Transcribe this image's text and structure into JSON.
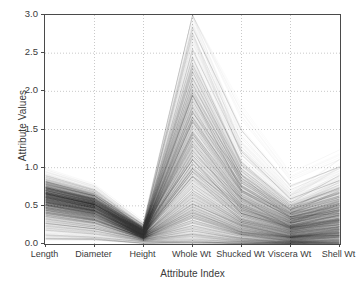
{
  "chart_data": {
    "type": "line",
    "title": "",
    "xlabel": "Attribute Index",
    "ylabel": "Attribute Values",
    "categories": [
      "Length",
      "Diameter",
      "Height",
      "Whole Wt",
      "Shucked Wt",
      "Viscera Wt",
      "Shell Wt"
    ],
    "ylim": [
      0.0,
      3.0
    ],
    "yticks": [
      "0.0",
      "0.5",
      "1.0",
      "1.5",
      "2.0",
      "2.5",
      "3.0"
    ],
    "ytick_values": [
      0.0,
      0.5,
      1.0,
      1.5,
      2.0,
      2.5,
      3.0
    ],
    "grid": true,
    "grid_style": "dotted",
    "legend": "none",
    "line_color": "#2b2b2b",
    "line_opacity": 0.12,
    "axis_color": "#4a4a4a",
    "grid_color": "#bbbbbb",
    "background": "#ffffff",
    "note": "Parallel coordinates plot of abalone physical measurements; each polyline is one specimen.",
    "axis_ranges": [
      {
        "name": "Length",
        "min": 0.07,
        "max": 0.82,
        "median": 0.55
      },
      {
        "name": "Diameter",
        "min": 0.06,
        "max": 0.65,
        "median": 0.43
      },
      {
        "name": "Height",
        "min": 0.01,
        "max": 0.26,
        "median": 0.14
      },
      {
        "name": "Whole Wt",
        "min": 0.02,
        "max": 2.83,
        "median": 0.8
      },
      {
        "name": "Shucked Wt",
        "min": 0.01,
        "max": 1.49,
        "median": 0.34
      },
      {
        "name": "Viscera Wt",
        "min": 0.0,
        "max": 0.76,
        "median": 0.17
      },
      {
        "name": "Shell Wt",
        "min": 0.0,
        "max": 1.01,
        "median": 0.23
      }
    ],
    "series": [
      {
        "name": "s1",
        "values": [
          0.82,
          0.65,
          0.25,
          2.83,
          1.49,
          0.76,
          1.01
        ]
      },
      {
        "name": "s2",
        "values": [
          0.78,
          0.63,
          0.22,
          2.55,
          1.21,
          0.59,
          0.83
        ]
      },
      {
        "name": "s3",
        "values": [
          0.8,
          0.63,
          0.23,
          2.44,
          1.04,
          0.54,
          0.9
        ]
      },
      {
        "name": "s4",
        "values": [
          0.76,
          0.6,
          0.21,
          2.35,
          1.07,
          0.51,
          0.72
        ]
      },
      {
        "name": "s5",
        "values": [
          0.75,
          0.6,
          0.2,
          2.26,
          0.98,
          0.49,
          0.74
        ]
      },
      {
        "name": "s6",
        "values": [
          0.74,
          0.59,
          0.19,
          2.18,
          0.95,
          0.47,
          0.68
        ]
      },
      {
        "name": "s7",
        "values": [
          0.73,
          0.58,
          0.2,
          2.1,
          0.9,
          0.45,
          0.66
        ]
      },
      {
        "name": "s8",
        "values": [
          0.74,
          0.59,
          0.18,
          2.03,
          0.86,
          0.44,
          0.63
        ]
      },
      {
        "name": "s9",
        "values": [
          0.72,
          0.57,
          0.18,
          1.95,
          0.83,
          0.42,
          0.61
        ]
      },
      {
        "name": "s10",
        "values": [
          0.71,
          0.56,
          0.19,
          1.88,
          0.8,
          0.41,
          0.59
        ]
      },
      {
        "name": "s11",
        "values": [
          0.72,
          0.57,
          0.17,
          1.8,
          0.77,
          0.39,
          0.57
        ]
      },
      {
        "name": "s12",
        "values": [
          0.7,
          0.55,
          0.17,
          1.73,
          0.74,
          0.38,
          0.55
        ]
      },
      {
        "name": "s13",
        "values": [
          0.69,
          0.55,
          0.18,
          1.66,
          0.71,
          0.36,
          0.53
        ]
      },
      {
        "name": "s14",
        "values": [
          0.7,
          0.56,
          0.16,
          1.6,
          0.68,
          0.35,
          0.51
        ]
      },
      {
        "name": "s15",
        "values": [
          0.68,
          0.54,
          0.16,
          1.53,
          0.65,
          0.33,
          0.49
        ]
      },
      {
        "name": "s16",
        "values": [
          0.67,
          0.53,
          0.17,
          1.47,
          0.63,
          0.32,
          0.47
        ]
      },
      {
        "name": "s17",
        "values": [
          0.68,
          0.54,
          0.15,
          1.4,
          0.6,
          0.31,
          0.45
        ]
      },
      {
        "name": "s18",
        "values": [
          0.66,
          0.52,
          0.15,
          1.34,
          0.57,
          0.29,
          0.43
        ]
      },
      {
        "name": "s19",
        "values": [
          0.65,
          0.51,
          0.16,
          1.28,
          0.55,
          0.28,
          0.41
        ]
      },
      {
        "name": "s20",
        "values": [
          0.66,
          0.52,
          0.14,
          1.22,
          0.52,
          0.27,
          0.4
        ]
      },
      {
        "name": "s21",
        "values": [
          0.64,
          0.5,
          0.14,
          1.16,
          0.5,
          0.25,
          0.38
        ]
      },
      {
        "name": "s22",
        "values": [
          0.63,
          0.49,
          0.15,
          1.1,
          0.47,
          0.24,
          0.36
        ]
      },
      {
        "name": "s23",
        "values": [
          0.62,
          0.49,
          0.13,
          1.05,
          0.45,
          0.23,
          0.34
        ]
      },
      {
        "name": "s24",
        "values": [
          0.61,
          0.48,
          0.13,
          0.99,
          0.43,
          0.22,
          0.33
        ]
      },
      {
        "name": "s25",
        "values": [
          0.6,
          0.47,
          0.14,
          0.94,
          0.4,
          0.21,
          0.31
        ]
      },
      {
        "name": "s26",
        "values": [
          0.59,
          0.46,
          0.12,
          0.89,
          0.38,
          0.19,
          0.29
        ]
      },
      {
        "name": "s27",
        "values": [
          0.58,
          0.45,
          0.12,
          0.84,
          0.36,
          0.18,
          0.28
        ]
      },
      {
        "name": "s28",
        "values": [
          0.57,
          0.44,
          0.13,
          0.79,
          0.34,
          0.17,
          0.26
        ]
      },
      {
        "name": "s29",
        "values": [
          0.56,
          0.43,
          0.11,
          0.74,
          0.32,
          0.16,
          0.25
        ]
      },
      {
        "name": "s30",
        "values": [
          0.55,
          0.43,
          0.11,
          0.7,
          0.3,
          0.15,
          0.23
        ]
      },
      {
        "name": "s31",
        "values": [
          0.54,
          0.42,
          0.12,
          0.65,
          0.28,
          0.14,
          0.22
        ]
      },
      {
        "name": "s32",
        "values": [
          0.52,
          0.4,
          0.1,
          0.61,
          0.26,
          0.13,
          0.2
        ]
      },
      {
        "name": "s33",
        "values": [
          0.51,
          0.39,
          0.1,
          0.57,
          0.24,
          0.12,
          0.19
        ]
      },
      {
        "name": "s34",
        "values": [
          0.5,
          0.38,
          0.11,
          0.53,
          0.23,
          0.11,
          0.18
        ]
      },
      {
        "name": "s35",
        "values": [
          0.48,
          0.37,
          0.09,
          0.49,
          0.21,
          0.1,
          0.16
        ]
      },
      {
        "name": "s36",
        "values": [
          0.47,
          0.36,
          0.09,
          0.45,
          0.19,
          0.1,
          0.15
        ]
      },
      {
        "name": "s37",
        "values": [
          0.45,
          0.34,
          0.1,
          0.41,
          0.18,
          0.09,
          0.14
        ]
      },
      {
        "name": "s38",
        "values": [
          0.44,
          0.33,
          0.08,
          0.38,
          0.16,
          0.08,
          0.12
        ]
      },
      {
        "name": "s39",
        "values": [
          0.42,
          0.32,
          0.08,
          0.34,
          0.15,
          0.07,
          0.11
        ]
      },
      {
        "name": "s40",
        "values": [
          0.4,
          0.3,
          0.09,
          0.31,
          0.13,
          0.06,
          0.1
        ]
      },
      {
        "name": "s41",
        "values": [
          0.38,
          0.28,
          0.07,
          0.27,
          0.12,
          0.05,
          0.09
        ]
      },
      {
        "name": "s42",
        "values": [
          0.36,
          0.27,
          0.07,
          0.24,
          0.1,
          0.05,
          0.08
        ]
      },
      {
        "name": "s43",
        "values": [
          0.33,
          0.24,
          0.08,
          0.2,
          0.08,
          0.04,
          0.06
        ]
      },
      {
        "name": "s44",
        "values": [
          0.3,
          0.22,
          0.06,
          0.17,
          0.07,
          0.03,
          0.05
        ]
      },
      {
        "name": "s45",
        "values": [
          0.27,
          0.2,
          0.06,
          0.13,
          0.05,
          0.03,
          0.04
        ]
      },
      {
        "name": "s46",
        "values": [
          0.23,
          0.17,
          0.05,
          0.1,
          0.04,
          0.02,
          0.03
        ]
      },
      {
        "name": "s47",
        "values": [
          0.18,
          0.13,
          0.04,
          0.06,
          0.03,
          0.01,
          0.02
        ]
      },
      {
        "name": "s48",
        "values": [
          0.12,
          0.09,
          0.03,
          0.03,
          0.01,
          0.01,
          0.01
        ]
      },
      {
        "name": "s49",
        "values": [
          0.07,
          0.06,
          0.01,
          0.02,
          0.01,
          0.0,
          0.0
        ]
      },
      {
        "name": "s50",
        "values": [
          0.6,
          0.47,
          0.1,
          1.62,
          0.75,
          0.36,
          0.4
        ]
      },
      {
        "name": "s51",
        "values": [
          0.63,
          0.49,
          0.14,
          1.45,
          0.55,
          0.3,
          0.48
        ]
      },
      {
        "name": "s52",
        "values": [
          0.66,
          0.52,
          0.18,
          1.1,
          0.4,
          0.22,
          0.38
        ]
      },
      {
        "name": "s53",
        "values": [
          0.58,
          0.45,
          0.12,
          0.95,
          0.48,
          0.2,
          0.25
        ]
      },
      {
        "name": "s54",
        "values": [
          0.7,
          0.55,
          0.22,
          1.95,
          0.7,
          0.4,
          0.7
        ]
      },
      {
        "name": "s55",
        "values": [
          0.52,
          0.4,
          0.09,
          0.52,
          0.25,
          0.1,
          0.14
        ]
      },
      {
        "name": "s56",
        "values": [
          0.55,
          0.44,
          0.13,
          0.88,
          0.3,
          0.18,
          0.3
        ]
      },
      {
        "name": "s57",
        "values": [
          0.72,
          0.58,
          0.16,
          1.72,
          0.9,
          0.33,
          0.44
        ]
      },
      {
        "name": "s58",
        "values": [
          0.46,
          0.35,
          0.12,
          0.43,
          0.15,
          0.09,
          0.17
        ]
      },
      {
        "name": "s59",
        "values": [
          0.68,
          0.53,
          0.2,
          1.3,
          0.45,
          0.26,
          0.52
        ]
      },
      {
        "name": "s60",
        "values": [
          0.61,
          0.48,
          0.11,
          1.18,
          0.6,
          0.22,
          0.28
        ]
      }
    ]
  }
}
